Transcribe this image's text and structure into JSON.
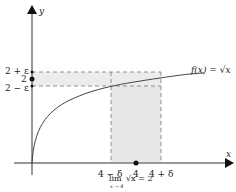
{
  "figure": {
    "y_axis_label": "y",
    "x_axis_label": "x",
    "y_ticks": [
      "2 + ε",
      "2",
      "2 − ε"
    ],
    "x_ticks": [
      "4 − δ",
      "4",
      "4 + δ"
    ],
    "function_label": "f(x) = √x",
    "caption_main": "lim √x = 2",
    "caption_lim": "lim",
    "caption_sub": "x → 4",
    "caption_expr": "√x = 2",
    "colors": {
      "axis": "#333333",
      "shade": "#e6e6e6",
      "dash": "#777777",
      "curve": "#444444"
    }
  }
}
